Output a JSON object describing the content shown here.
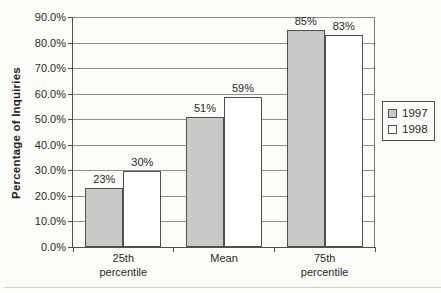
{
  "chart_data": {
    "type": "bar",
    "title": "",
    "xlabel": "",
    "ylabel": "Percentage of Inquiries",
    "categories": [
      "25th percentile",
      "Mean",
      "75th percentile"
    ],
    "series": [
      {
        "name": "1997",
        "values": [
          23,
          51,
          85
        ],
        "data_labels": [
          "23%",
          "51%",
          "85%"
        ],
        "fill": "#c8c8c6"
      },
      {
        "name": "1998",
        "values": [
          30,
          59,
          83
        ],
        "data_labels": [
          "30%",
          "59%",
          "83%"
        ],
        "fill": "#ffffff"
      }
    ],
    "ylim": [
      0,
      90
    ],
    "ytick_step": 10,
    "ytick_labels": [
      "0.0%",
      "10.0%",
      "20.0%",
      "30.0%",
      "40.0%",
      "50.0%",
      "60.0%",
      "70.0%",
      "80.0%",
      "90.0%"
    ],
    "grid": true,
    "legend_position": "right",
    "legend_entries": [
      "1997",
      "1998"
    ],
    "colors": {
      "gridline": "#8f8f8f",
      "axis": "#4f4f4f",
      "plot_right_border": "#7a7a7a",
      "bar_border": "#4f4f4f",
      "text": "#2a2a2a",
      "background": "#fbfbf8"
    }
  }
}
